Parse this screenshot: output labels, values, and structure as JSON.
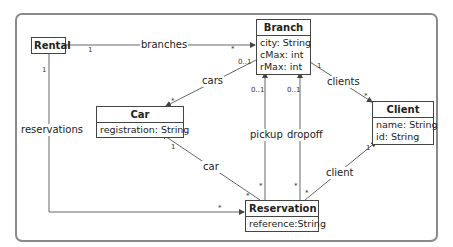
{
  "diagram": {
    "type": "UML class diagram",
    "classes": [
      {
        "id": "rental",
        "name": "Rental",
        "attributes": []
      },
      {
        "id": "branch",
        "name": "Branch",
        "attributes": [
          "city: String",
          "cMax: int",
          "rMax: int"
        ]
      },
      {
        "id": "car",
        "name": "Car",
        "attributes": [
          "registration: String"
        ]
      },
      {
        "id": "client",
        "name": "Client",
        "attributes": [
          "name: String",
          "id: String"
        ]
      },
      {
        "id": "reservation",
        "name": "Reservation",
        "attributes": [
          "reference:String"
        ]
      }
    ],
    "associations": [
      {
        "id": "branches",
        "label": "branches",
        "from": "Rental",
        "to": "Branch",
        "from_mult": "1",
        "to_mult": "*"
      },
      {
        "id": "cars",
        "label": "cars",
        "from": "Branch",
        "to": "Car",
        "from_mult": "0..1",
        "to_mult": "*"
      },
      {
        "id": "clients",
        "label": "clients",
        "from": "Branch",
        "to": "Client",
        "from_mult": "1",
        "to_mult": "*"
      },
      {
        "id": "reservations",
        "label": "reservations",
        "from": "Rental",
        "to": "Reservation",
        "from_mult": "1",
        "to_mult": "*"
      },
      {
        "id": "car",
        "label": "car",
        "from": "Reservation",
        "to": "Car",
        "from_mult": "*",
        "to_mult": "1"
      },
      {
        "id": "pickup",
        "label": "pickup",
        "from": "Reservation",
        "to": "Branch",
        "from_mult": "*",
        "to_mult": "0..1"
      },
      {
        "id": "dropoff",
        "label": "dropoff",
        "from": "Reservation",
        "to": "Branch",
        "from_mult": "*",
        "to_mult": "0..1"
      },
      {
        "id": "client",
        "label": "client",
        "from": "Reservation",
        "to": "Client",
        "from_mult": "*",
        "to_mult": "1"
      }
    ],
    "colors": {
      "frame": "#8a8a8a",
      "line": "#555555",
      "box_border": "#444444"
    }
  }
}
